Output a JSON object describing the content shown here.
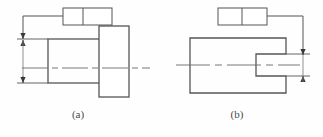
{
  "figure": {
    "type": "engineering-drawing",
    "background_color": "#fefefe",
    "line_color": "#555555",
    "centerline_color": "#6a6a6a",
    "caption_color": "#4a4a4a",
    "width": 323,
    "height": 137
  },
  "panels": [
    {
      "id": "a",
      "caption": "(a)",
      "description": "stepped shaft with flange, vertical dimension on left",
      "part_outline": {
        "shaft": {
          "x": 48,
          "y": 39,
          "width": 57,
          "height": 44
        },
        "flange": {
          "x": 99,
          "y": 26,
          "width": 30,
          "height": 71
        }
      },
      "centerline": {
        "x1": 22,
        "y1": 68,
        "x2": 150,
        "y2": 68
      },
      "dimension": {
        "orientation": "vertical",
        "line_x": 23,
        "y_top": 39,
        "y_bottom": 83,
        "arrow_top_y": 39,
        "arrow_bottom_y": 83,
        "extension_top_y": 39,
        "extension_bottom_y": 83,
        "value": ""
      },
      "leader": {
        "from_box_x": 63,
        "horizontal_y": 16,
        "vertical_x": 23,
        "vertical_to_y": 33
      },
      "callout_box": {
        "x": 63,
        "y": 8,
        "width": 49,
        "height": 17,
        "divider_x": 83,
        "left_cell_text": "",
        "right_cell_text": ""
      }
    },
    {
      "id": "b",
      "caption": "(b)",
      "description": "block with open slot on right side, vertical dimension on right",
      "part_outline": {
        "body": {
          "x": 190,
          "y": 38,
          "width": 96,
          "height": 55
        },
        "slot": {
          "x": 256,
          "y": 54,
          "width": 30,
          "height": 22
        }
      },
      "centerline": {
        "x1": 176,
        "y1": 65,
        "x2": 300,
        "y2": 65
      },
      "dimension": {
        "orientation": "vertical",
        "line_x": 303,
        "y_top": 54,
        "y_bottom": 76,
        "arrow_top_y": 54,
        "arrow_bottom_y": 76,
        "value": ""
      },
      "leader": {
        "from_box_x": 267,
        "horizontal_y": 16,
        "vertical_x": 303,
        "vertical_to_y": 50
      },
      "callout_box": {
        "x": 218,
        "y": 8,
        "width": 49,
        "height": 17,
        "divider_x": 242,
        "left_cell_text": "",
        "right_cell_text": ""
      }
    }
  ]
}
